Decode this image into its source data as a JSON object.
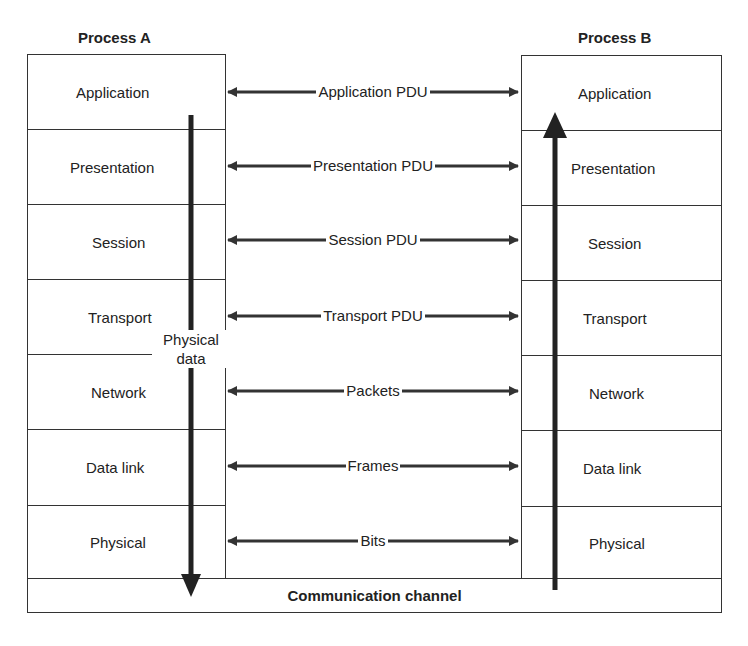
{
  "process_a": {
    "title": "Process A",
    "layers": [
      "Application",
      "Presentation",
      "Session",
      "Transport",
      "Network",
      "Data link",
      "Physical"
    ]
  },
  "process_b": {
    "title": "Process B",
    "layers": [
      "Application",
      "Presentation",
      "Session",
      "Transport",
      "Network",
      "Data link",
      "Physical"
    ]
  },
  "pdus": [
    "Application PDU",
    "Presentation PDU",
    "Session PDU",
    "Transport PDU",
    "Packets",
    "Frames",
    "Bits"
  ],
  "down_arrow_label": [
    "Physical",
    "data"
  ],
  "channel": {
    "label": "Communication channel"
  },
  "colors": {
    "line": "#333333",
    "text": "#222222",
    "background": "#ffffff"
  }
}
